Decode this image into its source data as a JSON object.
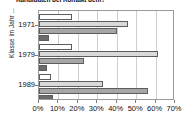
{
  "chart_data": {
    "type": "bar",
    "orientation": "horizontal",
    "title": "Kandidaten bei Kontakt dem?",
    "xlabel": "",
    "ylabel": "Klasse im Jahr ...",
    "categories": [
      "1971",
      "1979",
      "1989"
    ],
    "xlim": [
      0,
      70
    ],
    "xticks": [
      0,
      10,
      20,
      30,
      40,
      50,
      60,
      70
    ],
    "xticklabels": [
      "0%",
      "10%",
      "20%",
      "30%",
      "40%",
      "50%",
      "60%",
      "70%"
    ],
    "grid": true,
    "legend": "none",
    "series": [
      {
        "name": "series-1",
        "color": "#ffffff",
        "values": [
          17,
          17,
          6
        ]
      },
      {
        "name": "series-2",
        "color": "#d9d9d9",
        "values": [
          46,
          61,
          33
        ]
      },
      {
        "name": "series-3",
        "color": "#a6a6a6",
        "values": [
          40,
          23,
          56
        ]
      },
      {
        "name": "series-4",
        "color": "#6b6b6b",
        "values": [
          5,
          4,
          7
        ]
      }
    ]
  }
}
